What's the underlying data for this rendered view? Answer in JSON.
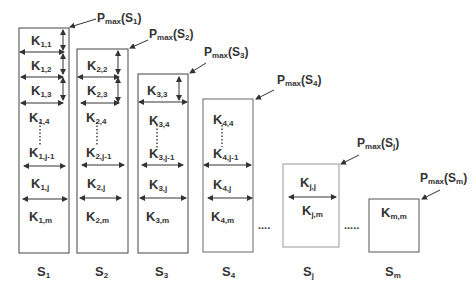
{
  "diagram": {
    "columns": [
      {
        "id": "S1",
        "label_main": "S",
        "label_sub": "1",
        "pmax_main": "P",
        "pmax_sub": "max",
        "pmax_arg": "(S",
        "pmax_arg_sub": "1",
        "pmax_close": ")",
        "cells": [
          {
            "main": "K",
            "sub": "1,1"
          },
          {
            "main": "K",
            "sub": "1,2"
          },
          {
            "main": "K",
            "sub": "1,3"
          },
          {
            "main": "K",
            "sub": "1,4"
          },
          {
            "main": "K",
            "sub": "1,j-1"
          },
          {
            "main": "K",
            "sub": "1,j"
          },
          {
            "main": "K",
            "sub": "1,m"
          }
        ]
      },
      {
        "id": "S2",
        "label_main": "S",
        "label_sub": "2",
        "pmax_main": "P",
        "pmax_sub": "max",
        "pmax_arg": "(S",
        "pmax_arg_sub": "2",
        "pmax_close": ")",
        "cells": [
          {
            "main": "K",
            "sub": "2,2"
          },
          {
            "main": "K",
            "sub": "2,3"
          },
          {
            "main": "K",
            "sub": "2,4"
          },
          {
            "main": "K",
            "sub": "2,j-1"
          },
          {
            "main": "K",
            "sub": "2,j"
          },
          {
            "main": "K",
            "sub": "2,m"
          }
        ]
      },
      {
        "id": "S3",
        "label_main": "S",
        "label_sub": "3",
        "pmax_main": "P",
        "pmax_sub": "max",
        "pmax_arg": "(S",
        "pmax_arg_sub": "3",
        "pmax_close": ")",
        "cells": [
          {
            "main": "K",
            "sub": "3,3"
          },
          {
            "main": "K",
            "sub": "3,4"
          },
          {
            "main": "K",
            "sub": "3,j-1"
          },
          {
            "main": "K",
            "sub": "3,j"
          },
          {
            "main": "K",
            "sub": "3,m"
          }
        ]
      },
      {
        "id": "S4",
        "label_main": "S",
        "label_sub": "4",
        "pmax_main": "P",
        "pmax_sub": "max",
        "pmax_arg": "(S",
        "pmax_arg_sub": "4",
        "pmax_close": ")",
        "cells": [
          {
            "main": "K",
            "sub": "4,4"
          },
          {
            "main": "K",
            "sub": "4,j-1"
          },
          {
            "main": "K",
            "sub": "4,j"
          },
          {
            "main": "K",
            "sub": "4,m"
          }
        ]
      },
      {
        "id": "Sj",
        "label_main": "S",
        "label_sub": "j",
        "pmax_main": "P",
        "pmax_sub": "max",
        "pmax_arg": "(S",
        "pmax_arg_sub": "j",
        "pmax_close": ")",
        "cells": [
          {
            "main": "K",
            "sub": "j,j"
          },
          {
            "main": "K",
            "sub": "j,m"
          }
        ]
      },
      {
        "id": "Sm",
        "label_main": "S",
        "label_sub": "m",
        "pmax_main": "P",
        "pmax_sub": "max",
        "pmax_arg": "(S",
        "pmax_arg_sub": "m",
        "pmax_close": ")",
        "cells": [
          {
            "main": "K",
            "sub": "m,m"
          }
        ]
      }
    ],
    "ellipsis": "....",
    "ellipsis2": "....."
  }
}
